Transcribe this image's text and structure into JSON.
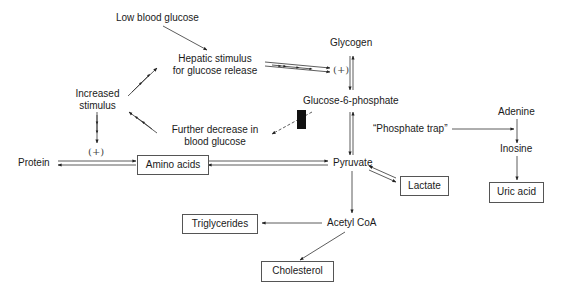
{
  "diagram": {
    "type": "metabolic-pathway",
    "nodes": {
      "low_blood_glucose": "Low blood glucose",
      "hepatic_stimulus_line1": "Hepatic stimulus",
      "hepatic_stimulus_line2": "for glucose release",
      "increased_stimulus_line1": "Increased",
      "increased_stimulus_line2": "stimulus",
      "further_decrease_line1": "Further decrease in",
      "further_decrease_line2": "blood glucose",
      "glycogen": "Glycogen",
      "glucose_6_phosphate": "Glucose-6-phosphate",
      "protein": "Protein",
      "amino_acids": "Amino acids",
      "pyruvate": "Pyruvate",
      "lactate": "Lactate",
      "phosphate_trap": "“Phosphate trap”",
      "adenine": "Adenine",
      "inosine": "Inosine",
      "uric_acid": "Uric acid",
      "acetyl_coa": "Acetyl CoA",
      "triglycerides": "Triglycerides",
      "cholesterol": "Cholesterol"
    },
    "stimulation_marks": {
      "glycogen_stim": "(+)",
      "protein_stim": "(+)"
    },
    "edges": [
      {
        "from": "Low blood glucose",
        "to": "Hepatic stimulus for glucose release",
        "style": "solid"
      },
      {
        "from": "Hepatic stimulus for glucose release",
        "to": "Glycogen",
        "style": "arrowed-double",
        "mark": "(+)"
      },
      {
        "from": "Glycogen",
        "to": "Glucose-6-phosphate",
        "style": "reversible"
      },
      {
        "from": "Glucose-6-phosphate",
        "to": "Pyruvate",
        "style": "reversible"
      },
      {
        "from": "Glucose-6-phosphate",
        "to": "Further decrease in blood glucose",
        "style": "dashed-blocked"
      },
      {
        "from": "Further decrease in blood glucose",
        "to": "Increased stimulus",
        "style": "arrowed"
      },
      {
        "from": "Increased stimulus",
        "to": "Hepatic stimulus for glucose release",
        "style": "arrowed"
      },
      {
        "from": "Increased stimulus",
        "to": "Protein/Amino acids",
        "style": "arrowed",
        "mark": "(+)"
      },
      {
        "from": "Protein",
        "to": "Amino acids",
        "style": "reversible"
      },
      {
        "from": "Amino acids",
        "to": "Pyruvate",
        "style": "reversible"
      },
      {
        "from": "Pyruvate",
        "to": "Lactate",
        "style": "reversible"
      },
      {
        "from": "Pyruvate",
        "to": "Acetyl CoA",
        "style": "solid"
      },
      {
        "from": "Acetyl CoA",
        "to": "Triglycerides",
        "style": "solid"
      },
      {
        "from": "Acetyl CoA",
        "to": "Cholesterol",
        "style": "solid"
      },
      {
        "from": "Phosphate trap",
        "to": "Adenine-Inosine",
        "style": "solid"
      },
      {
        "from": "Adenine",
        "to": "Inosine",
        "style": "solid"
      },
      {
        "from": "Inosine",
        "to": "Uric acid",
        "style": "solid"
      }
    ]
  }
}
